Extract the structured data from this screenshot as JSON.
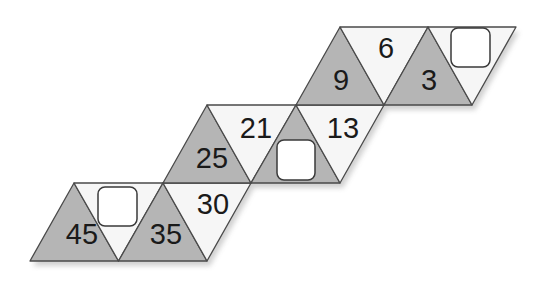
{
  "puzzle": {
    "type": "triangle-strip number puzzle",
    "colors": {
      "gray_fill": "#b5b5b5",
      "white_fill": "#f6f6f6",
      "stroke": "#4a4a4a",
      "box_fill": "#ffffff",
      "box_stroke": "#3a3a3a",
      "shadow": "#d8d8d8"
    },
    "rows": [
      {
        "name": "bottom-band",
        "cells": [
          {
            "shade": "gray",
            "value": "45"
          },
          {
            "shade": "white",
            "value": null,
            "blank": true
          },
          {
            "shade": "gray",
            "value": "35"
          },
          {
            "shade": "white",
            "value": "30"
          }
        ]
      },
      {
        "name": "middle-band",
        "cells": [
          {
            "shade": "gray",
            "value": "25"
          },
          {
            "shade": "white",
            "value": "21"
          },
          {
            "shade": "gray",
            "value": null,
            "blank": true
          },
          {
            "shade": "white",
            "value": "13"
          }
        ]
      },
      {
        "name": "top-band",
        "cells": [
          {
            "shade": "gray",
            "value": "9"
          },
          {
            "shade": "white",
            "value": "6"
          },
          {
            "shade": "gray",
            "value": "3"
          },
          {
            "shade": "white",
            "value": null,
            "blank": true
          }
        ]
      }
    ],
    "labels": {
      "n45": "45",
      "n35": "35",
      "n30": "30",
      "n25": "25",
      "n21": "21",
      "n13": "13",
      "n9": "9",
      "n6": "6",
      "n3": "3"
    },
    "blank_boxes": 3
  }
}
